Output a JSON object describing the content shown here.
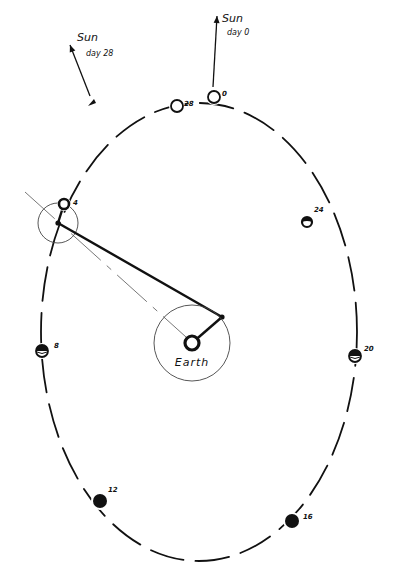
{
  "diagram": {
    "type": "lunar-orbit-phases",
    "ink_color": "#111111",
    "background": "#ffffff",
    "earth": {
      "label": "Earth",
      "cx": 192,
      "cy": 343,
      "inner_radius": 7,
      "circle_radius": 38
    },
    "sun_arrows": [
      {
        "id": "sun-day-0",
        "title": "Sun",
        "subtitle": "day 0",
        "x1": 213,
        "y1": 87,
        "x2": 217,
        "y2": 16,
        "tx": 222,
        "ty": 22,
        "sx": 227,
        "sy": 35
      },
      {
        "id": "sun-day-28",
        "title": "Sun",
        "subtitle": "day 28",
        "x1": 90,
        "y1": 96,
        "x2": 70,
        "y2": 45,
        "tx": 77,
        "ty": 41,
        "sx": 86,
        "sy": 56
      }
    ],
    "orbit": {
      "cx": 199,
      "cy": 332,
      "rx": 158,
      "ry": 229
    },
    "moons": [
      {
        "day": "0",
        "cx": 214,
        "cy": 97,
        "r": 6,
        "phase": "new",
        "label_x": 222,
        "label_y": 96
      },
      {
        "day": "28",
        "cx": 177,
        "cy": 106,
        "r": 6,
        "phase": "new",
        "label_x": 184,
        "label_y": 106
      },
      {
        "day": "4",
        "cx": 64,
        "cy": 204,
        "r": 5,
        "phase": "new-thin",
        "label_x": 73,
        "label_y": 205
      },
      {
        "day": "24",
        "cx": 307,
        "cy": 222,
        "r": 5,
        "phase": "crescent-top",
        "label_x": 314,
        "label_y": 212
      },
      {
        "day": "8",
        "cx": 42,
        "cy": 351,
        "r": 6,
        "phase": "half-top",
        "label_x": 54,
        "label_y": 348
      },
      {
        "day": "20",
        "cx": 355,
        "cy": 356,
        "r": 6,
        "phase": "half-top",
        "label_x": 364,
        "label_y": 351
      },
      {
        "day": "12",
        "cx": 100,
        "cy": 501,
        "r": 7,
        "phase": "full-dark",
        "label_x": 108,
        "label_y": 492
      },
      {
        "day": "16",
        "cx": 292,
        "cy": 521,
        "r": 7,
        "phase": "full-dark",
        "label_x": 303,
        "label_y": 519
      }
    ],
    "construction": {
      "small_circle": {
        "cx": 58,
        "cy": 223,
        "r": 20
      },
      "thick_line": {
        "x1": 58,
        "y1": 223,
        "x2": 222,
        "y2": 317
      },
      "earth_arm": {
        "x1": 192,
        "y1": 343,
        "x2": 222,
        "y2": 317
      },
      "moon_arm": {
        "x1": 58,
        "y1": 223,
        "x2": 64,
        "y2": 204
      },
      "thin_sight_line": {
        "x1": 25,
        "y1": 192,
        "x2": 186,
        "y2": 337
      }
    }
  }
}
